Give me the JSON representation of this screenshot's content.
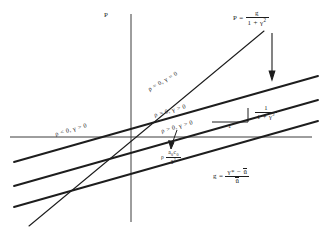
{
  "figure": {
    "type": "line-diagram",
    "background": "#ffffff",
    "ink_color": "#1d1d1d",
    "axes": {
      "vertical_axis_label": "P",
      "origin_px": [
        131,
        137
      ],
      "x_axis_y_px": 137,
      "y_axis_x_px": 131
    },
    "annotations": {
      "top_equation_lhs": "P =",
      "top_equation_num": "g",
      "top_equation_den_1": "1 + γ",
      "top_equation_den_sup": "2",
      "slope_label_num": "1",
      "slope_label_den_1": "1 + γ",
      "slope_label_den_sup": "2",
      "slope_run_label": "1",
      "bottom_equation_lhs": "g =",
      "bottom_equation_num_1": "γ*",
      "bottom_equation_num_minus": "−",
      "bottom_equation_num_2": "ū",
      "bottom_equation_den": "ū",
      "intercept_label_rho": "ρ",
      "intercept_num_a": "a",
      "intercept_num_a_sub": "0",
      "intercept_num_c": "c",
      "intercept_num_c_sub": "0",
      "intercept_den_a": "ā",
      "intercept_den_sup": "2"
    },
    "line_labels": [
      {
        "id": "steep-line-label",
        "text": "ρ = 0, γ = 0",
        "x": 150,
        "y": 86,
        "rotate": -30,
        "size": 6.2
      },
      {
        "id": "upper-line-label",
        "text": "ρ < 0, γ > 0",
        "x": 56,
        "y": 131,
        "rotate": -16,
        "size": 6.2
      },
      {
        "id": "middle-line-label",
        "text": "ρ = 0, γ > 0",
        "x": 155,
        "y": 112,
        "rotate": -16,
        "size": 6.2
      },
      {
        "id": "lower-line-label",
        "text": "ρ > 0, γ > 0",
        "x": 162,
        "y": 128,
        "rotate": -16,
        "size": 6.2
      }
    ],
    "lines": [
      {
        "id": "upper-parallel-line",
        "x1": 14,
        "y1": 162,
        "x2": 318,
        "y2": 76,
        "width": 1.9,
        "note": "rho<0, gamma>0"
      },
      {
        "id": "middle-parallel-line",
        "x1": 14,
        "y1": 186,
        "x2": 318,
        "y2": 100,
        "width": 1.9,
        "note": "rho=0, gamma>0"
      },
      {
        "id": "lower-parallel-line",
        "x1": 14,
        "y1": 207,
        "x2": 318,
        "y2": 121,
        "width": 1.9,
        "note": "rho>0, gamma>0"
      },
      {
        "id": "steep-origin-line",
        "x1": 29,
        "y1": 226,
        "x2": 264,
        "y2": 31,
        "width": 1.2,
        "note": "rho=0, gamma=0 through origin"
      }
    ],
    "arrows": [
      {
        "id": "down-arrow",
        "x1": 272,
        "y1": 33,
        "x2": 272,
        "y2": 78,
        "note": "points from P equation down to lines"
      },
      {
        "id": "pointer-arrow",
        "x1": 175,
        "y1": 132,
        "x2": 171,
        "y2": 148,
        "note": "points to intercept label"
      }
    ],
    "slope_triangle": {
      "x_left": 212,
      "x_right": 248,
      "y_base": 122,
      "y_top": 108
    }
  }
}
